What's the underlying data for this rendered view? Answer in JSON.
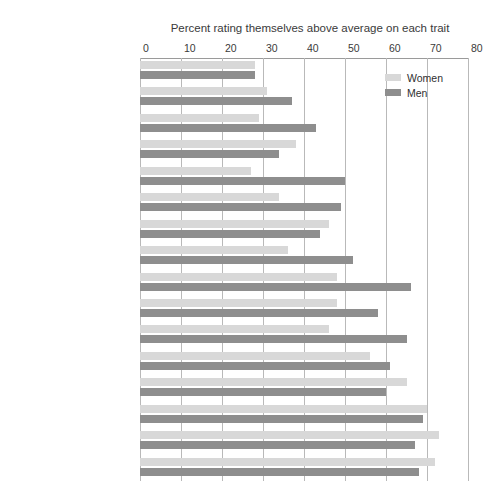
{
  "chart_data": {
    "type": "bar",
    "orientation": "horizontal",
    "title": "Percent rating themselves above average on each trait",
    "xlabel": "",
    "ylabel": "",
    "xlim": [
      0,
      80
    ],
    "xticks": [
      0,
      10,
      20,
      30,
      40,
      50,
      60,
      70,
      80
    ],
    "grid": true,
    "legend_position": "top-right",
    "categories": [
      "Artistic ability",
      "Public speaking ability",
      "Popularity",
      "Spirituality",
      "Computer skills",
      "Risk-taking",
      "Writing ability",
      "Mathematical ability",
      "Self-confidence",
      "Emotional health",
      "Physical health",
      "Leadership ability",
      "Understanding of others",
      "Academic ability",
      "Drive to achieve",
      "Cooperativeness"
    ],
    "series": [
      {
        "name": "Women",
        "color": "#d8d8d8",
        "values": [
          28,
          31,
          29,
          38,
          27,
          34,
          46,
          36,
          48,
          48,
          46,
          56,
          65,
          70,
          73,
          72
        ]
      },
      {
        "name": "Men",
        "color": "#8e8e8e",
        "values": [
          28,
          37,
          43,
          34,
          50,
          49,
          44,
          52,
          66,
          58,
          65,
          61,
          60,
          69,
          67,
          68
        ]
      }
    ]
  },
  "legend": {
    "entries": [
      {
        "label": "Women",
        "swatch": "women"
      },
      {
        "label": "Men",
        "swatch": "men"
      }
    ]
  }
}
